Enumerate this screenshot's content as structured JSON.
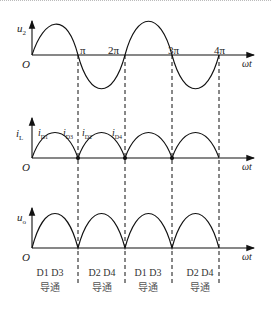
{
  "plots": [
    {
      "ylabel": "u",
      "ysub": "2",
      "origin": "O",
      "xlabel": "ωt",
      "ticks": [
        "π",
        "2π",
        "3π",
        "4π"
      ]
    },
    {
      "ylabel": "i",
      "ysub": "L",
      "origin": "O",
      "xlabel": "ωt",
      "currents": [
        "i",
        "i",
        "i",
        "i"
      ],
      "current_subs": [
        "D1",
        "D3",
        "D2",
        "D4"
      ]
    },
    {
      "ylabel": "u",
      "ysub": "o",
      "origin": "O",
      "xlabel": "ωt"
    }
  ],
  "captions": [
    {
      "diodes": "D1 D3",
      "state": "导通"
    },
    {
      "diodes": "D2 D4",
      "state": "导通"
    },
    {
      "diodes": "D1 D3",
      "state": "导通"
    },
    {
      "diodes": "D2 D4",
      "state": "导通"
    }
  ]
}
